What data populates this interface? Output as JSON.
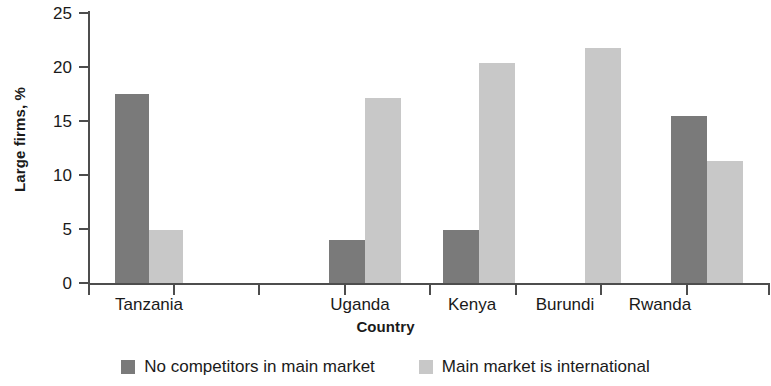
{
  "chart_data": {
    "type": "bar",
    "title": "",
    "xlabel": "Country",
    "ylabel": "Large firms, %",
    "categories": [
      "Tanzania",
      "",
      "Uganda",
      "Kenya",
      "Burundi",
      "Rwanda"
    ],
    "series": [
      {
        "name": "No competitors in main market",
        "color": "#7a7a7a",
        "values": [
          17.5,
          null,
          4.0,
          4.9,
          null,
          15.5
        ]
      },
      {
        "name": "Main market is international",
        "color": "#c8c8c8",
        "values": [
          4.9,
          null,
          17.1,
          20.4,
          21.8,
          11.3
        ]
      }
    ],
    "ylim": [
      0,
      25
    ],
    "yticks": [
      0,
      5,
      10,
      15,
      20,
      25
    ],
    "ytick_labels": [
      "0",
      "5",
      "10",
      "15",
      "20",
      "25"
    ],
    "grid": false,
    "legend_position": "bottom"
  },
  "axes": {
    "y_title": "Large firms, %",
    "x_title": "Country",
    "y_tick_labels": [
      "25",
      "20",
      "15",
      "10",
      "5",
      "0"
    ],
    "x_tick_labels": [
      "Tanzania",
      "Uganda",
      "Kenya",
      "Burundi",
      "Rwanda"
    ]
  },
  "legend": {
    "items": [
      {
        "label": "No competitors in main market",
        "color": "#7a7a7a"
      },
      {
        "label": "Main market is international",
        "color": "#c8c8c8"
      }
    ]
  }
}
